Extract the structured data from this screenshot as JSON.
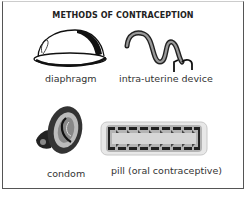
{
  "title": "METHODS OF CONTRACEPTION",
  "items": [
    {
      "label": "diaphragm",
      "icon": "diaphragm-icon"
    },
    {
      "label": "intra-uterine device",
      "icon": "iud-icon"
    },
    {
      "label": "condom",
      "icon": "condom-icon"
    },
    {
      "label": "pill (oral contraceptive)",
      "icon": "pill-pack-icon"
    }
  ]
}
